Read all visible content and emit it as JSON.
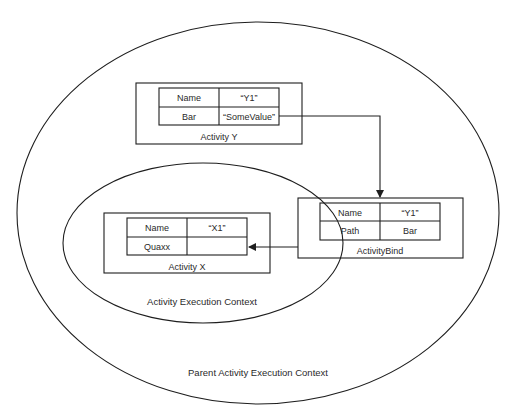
{
  "colors": {
    "stroke": "#1e1e1e",
    "text": "#2a2a2a",
    "background": "#ffffff"
  },
  "contexts": {
    "parent": {
      "label": "Parent Activity Execution Context"
    },
    "child": {
      "label": "Activity Execution Context"
    }
  },
  "activity_y": {
    "title": "Activity Y",
    "rows": [
      {
        "key": "Name",
        "value": "“Y1”"
      },
      {
        "key": "Bar",
        "value": "“SomeValue”"
      }
    ]
  },
  "activity_bind": {
    "title": "ActivityBind",
    "rows": [
      {
        "key": "Name",
        "value": "“Y1”"
      },
      {
        "key": "Path",
        "value": "Bar"
      }
    ]
  },
  "activity_x": {
    "title": "Activity X",
    "rows": [
      {
        "key": "Name",
        "value": "“X1”"
      },
      {
        "key": "Quaxx",
        "value": ""
      }
    ]
  },
  "connectors": [
    {
      "from": "activity_y.Bar",
      "to": "activity_bind",
      "arrow": "down"
    },
    {
      "from": "activity_bind",
      "to": "activity_x.Quaxx",
      "arrow": "left"
    }
  ]
}
